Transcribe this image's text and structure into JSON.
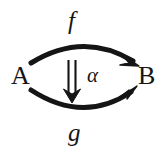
{
  "diagram": {
    "kind": "2-cell-natural-transformation-diagram",
    "background_color": "#ffffff",
    "ink_color": "#151515",
    "objects": {
      "source": "A",
      "target": "B"
    },
    "morphisms": {
      "top": "f",
      "bottom": "g"
    },
    "two_cell": {
      "symbol": "⇓",
      "symbol_name": "double-down-arrow",
      "label": "α"
    }
  }
}
